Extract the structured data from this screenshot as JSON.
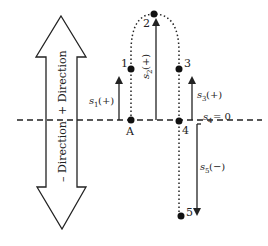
{
  "diagram": {
    "direction_arrow": {
      "up_label": "+ Direction",
      "down_label": "– Direction"
    },
    "points": [
      {
        "id": "A",
        "label": "A"
      },
      {
        "id": "1",
        "label": "1"
      },
      {
        "id": "2",
        "label": "2"
      },
      {
        "id": "3",
        "label": "3"
      },
      {
        "id": "4",
        "label": "4"
      },
      {
        "id": "5",
        "label": "5"
      }
    ],
    "displacements": [
      {
        "name": "s1",
        "sub": "1",
        "sign": "(+)"
      },
      {
        "name": "s2",
        "sub": "2",
        "sign": "(+)"
      },
      {
        "name": "s3",
        "sub": "3",
        "sign": "(+)"
      },
      {
        "name": "s4",
        "sub": "4",
        "sign": "= 0"
      },
      {
        "name": "s5",
        "sub": "5",
        "sign": "(−)"
      }
    ],
    "colors": {
      "stroke": "#222222",
      "background": "#ffffff"
    }
  }
}
